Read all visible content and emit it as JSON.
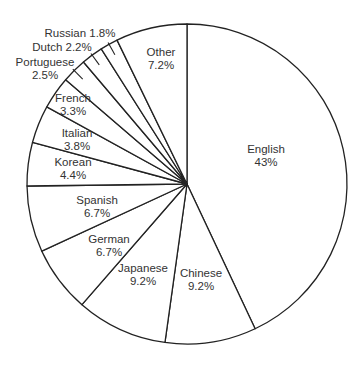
{
  "chart_data": {
    "type": "pie",
    "title": "",
    "start_angle": "12 o'clock",
    "direction": "clockwise",
    "legend": "none (labels placed on/near slices)",
    "categories": [
      "English",
      "Chinese",
      "Japanese",
      "German",
      "Spanish",
      "Korean",
      "Italian",
      "French",
      "Portuguese",
      "Dutch",
      "Russian",
      "Other"
    ],
    "values": [
      43,
      9.2,
      9.2,
      6.7,
      6.7,
      4.4,
      3.8,
      3.3,
      2.5,
      2.2,
      1.8,
      7.2
    ],
    "value_labels": [
      "43%",
      "9.2%",
      "9.2%",
      "6.7%",
      "6.7%",
      "4.4%",
      "3.8%",
      "3.3%",
      "2.5%",
      "2.2%",
      "1.8%",
      "7.2%"
    ],
    "unit": "%",
    "style": {
      "fill": "#ffffff",
      "stroke": "#222222",
      "text": "#333333"
    }
  },
  "labels": [
    {
      "name": "English",
      "pct": "43%",
      "x": 266,
      "y": 153,
      "inline": false,
      "anchor": "middle"
    },
    {
      "name": "Chinese",
      "pct": "9.2%",
      "x": 201,
      "y": 277,
      "inline": false,
      "anchor": "middle"
    },
    {
      "name": "Japanese",
      "pct": "9.2%",
      "x": 143,
      "y": 272,
      "inline": false,
      "anchor": "middle"
    },
    {
      "name": "German",
      "pct": "6.7%",
      "x": 109,
      "y": 243,
      "inline": false,
      "anchor": "middle"
    },
    {
      "name": "Spanish",
      "pct": "6.7%",
      "x": 97,
      "y": 204,
      "inline": false,
      "anchor": "middle"
    },
    {
      "name": "Korean",
      "pct": "4.4%",
      "x": 73,
      "y": 166,
      "inline": false,
      "anchor": "middle"
    },
    {
      "name": "Italian",
      "pct": "3.8%",
      "x": 77,
      "y": 137,
      "inline": false,
      "anchor": "middle"
    },
    {
      "name": "French",
      "pct": "3.3%",
      "x": 73,
      "y": 102,
      "inline": false,
      "anchor": "middle"
    },
    {
      "name": "Portuguese",
      "pct": "2.5%",
      "x": 45,
      "y": 66,
      "inline": false,
      "anchor": "middle"
    },
    {
      "name": "Dutch",
      "pct": "2.2%",
      "x": 62,
      "y": 51,
      "inline": true,
      "anchor": "middle"
    },
    {
      "name": "Russian",
      "pct": "1.8%",
      "x": 80,
      "y": 37,
      "inline": true,
      "anchor": "middle"
    },
    {
      "name": "Other",
      "pct": "7.2%",
      "x": 161,
      "y": 56,
      "inline": false,
      "anchor": "middle"
    }
  ]
}
